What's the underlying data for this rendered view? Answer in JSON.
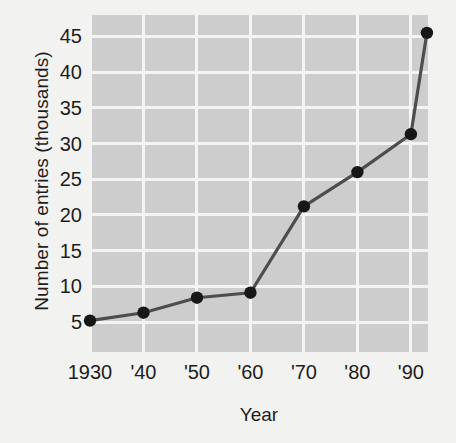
{
  "chart_data": {
    "type": "line",
    "title": "",
    "xlabel": "Year",
    "ylabel": "Number of entries (thousands)",
    "x": [
      1930,
      1940,
      1950,
      1960,
      1970,
      1980,
      1990,
      1993
    ],
    "values": [
      5.2,
      6.3,
      8.4,
      9.1,
      21.2,
      26.0,
      31.3,
      45.5
    ],
    "xtick_values": [
      1930,
      1940,
      1950,
      1960,
      1970,
      1980,
      1990
    ],
    "xtick_labels": [
      "1930",
      "'40",
      "'50",
      "'60",
      "'70",
      "'80",
      "'90"
    ],
    "ytick_values": [
      5,
      10,
      15,
      20,
      25,
      30,
      35,
      40,
      45
    ],
    "ytick_labels": [
      "5",
      "10",
      "15",
      "20",
      "25",
      "30",
      "35",
      "40",
      "45"
    ],
    "xlim": [
      1930,
      1993.2
    ],
    "ylim": [
      0.8,
      48.0
    ],
    "grid": true,
    "legend": "none",
    "series_name": "Number of entries",
    "marker": "circle",
    "colors": {
      "line": "#4d4d4d",
      "marker": "#171717",
      "plot_background": "#cdcdcd",
      "gridline": "#f4f4f2",
      "figure_background": "#f2f2f0",
      "text": "#1d1d1d"
    }
  }
}
